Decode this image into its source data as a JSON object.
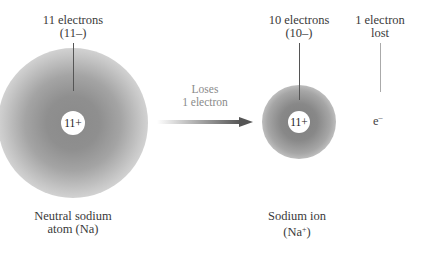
{
  "neutral_atom": {
    "electron_label_line1": "11 electrons",
    "electron_label_line2": "(11–)",
    "nucleus_charge": "11+",
    "caption_line1": "Neutral sodium",
    "caption_line2": "atom (Na)"
  },
  "process": {
    "label_line1": "Loses",
    "label_line2": "1 electron"
  },
  "ion": {
    "electron_label_line1": "10 electrons",
    "electron_label_line2": "(10–)",
    "nucleus_charge": "11+",
    "caption_line1": "Sodium ion",
    "caption_prefix": "(Na",
    "caption_sup": "+",
    "caption_suffix": ")"
  },
  "lost_electron": {
    "label_line1": "1 electron",
    "label_line2": "lost",
    "symbol": "e",
    "symbol_sup": "–"
  },
  "colors": {
    "text": "#3a3a3a",
    "process_text": "#8a8a8a",
    "cloud": "#8a8a8a",
    "leader_line": "#555555",
    "lost_leader_line": "#aaaaaa"
  }
}
